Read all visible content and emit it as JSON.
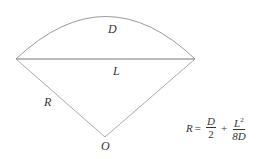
{
  "diagram": {
    "labels": {
      "sagitta": "D",
      "chord": "L",
      "radius": "R",
      "center": "O"
    },
    "formula": {
      "lhs": "R",
      "equals": "=",
      "term1_num": "D",
      "term1_den": "2",
      "plus": "+",
      "term2_num": "L",
      "term2_num_exp": "2",
      "term2_den": "8D"
    },
    "colors": {
      "stroke": "#999999",
      "text": "#333333"
    }
  }
}
